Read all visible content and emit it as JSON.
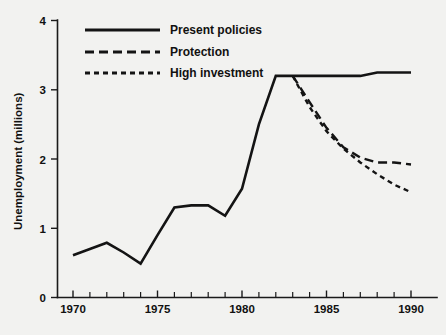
{
  "chart_data": {
    "type": "line",
    "title": "",
    "xlabel": "",
    "ylabel": "Unemployment (millions)",
    "xlim": [
      1970,
      1990
    ],
    "ylim": [
      0,
      4
    ],
    "yticks": [
      "0",
      "1",
      "2",
      "3",
      "4"
    ],
    "xticks": [
      "1970",
      "1975",
      "1980",
      "1985",
      "1990"
    ],
    "xtick_step": 1,
    "grid": false,
    "legend_position": "top-center",
    "series": [
      {
        "name": "Present policies",
        "style": "solid",
        "x": [
          1970,
          1971,
          1972,
          1973,
          1974,
          1975,
          1976,
          1977,
          1978,
          1979,
          1980,
          1981,
          1982,
          1983,
          1984,
          1985,
          1986,
          1987,
          1988,
          1989,
          1990
        ],
        "values": [
          0.61,
          0.7,
          0.79,
          0.65,
          0.49,
          0.9,
          1.3,
          1.33,
          1.33,
          1.18,
          1.57,
          2.5,
          3.2,
          3.2,
          3.2,
          3.2,
          3.2,
          3.2,
          3.25,
          3.25,
          3.25
        ]
      },
      {
        "name": "Protection",
        "style": "dashed-long",
        "x": [
          1983,
          1984,
          1985,
          1986,
          1987,
          1988,
          1989,
          1990
        ],
        "values": [
          3.2,
          2.82,
          2.45,
          2.17,
          2.02,
          1.95,
          1.95,
          1.92
        ]
      },
      {
        "name": "High investment",
        "style": "dashed-short",
        "x": [
          1983,
          1984,
          1985,
          1986,
          1987,
          1988,
          1989,
          1990
        ],
        "values": [
          3.2,
          2.75,
          2.4,
          2.15,
          1.95,
          1.78,
          1.63,
          1.52
        ]
      }
    ]
  },
  "legend": {
    "items": [
      {
        "label": "Present policies",
        "style": "solid"
      },
      {
        "label": "Protection",
        "style": "dashed-long"
      },
      {
        "label": "High investment",
        "style": "dashed-short"
      }
    ]
  },
  "colors": {
    "background": "#f2f2f0",
    "ink": "#141414"
  }
}
